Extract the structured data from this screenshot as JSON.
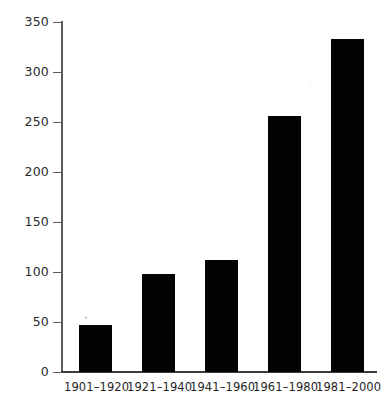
{
  "chart_data": {
    "type": "bar",
    "title": "",
    "xlabel": "",
    "ylabel": "",
    "categories": [
      "1901–1920",
      "1921–1940",
      "1941–1960",
      "1961–1980",
      "1981–2000"
    ],
    "values": [
      47,
      98,
      112,
      256,
      333
    ],
    "ylim": [
      0,
      350
    ],
    "yticks": [
      0,
      50,
      100,
      150,
      200,
      250,
      300,
      350
    ],
    "ytick_labels": [
      "0",
      "50",
      "100",
      "150",
      "200",
      "250",
      "300",
      "350"
    ],
    "grid": false,
    "legend": null,
    "bar_color": "#030303",
    "axis_color": "#4a4a4a",
    "background": "#ffffff"
  }
}
